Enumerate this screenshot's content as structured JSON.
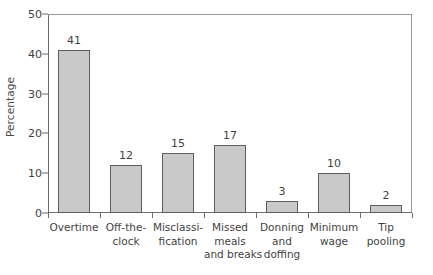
{
  "chart_data": {
    "type": "bar",
    "title": "",
    "subtitle": "",
    "xlabel": "",
    "ylabel": "Percentage",
    "ylim": [
      0,
      50
    ],
    "ytick_step": 10,
    "yticks": [
      0,
      10,
      20,
      30,
      40,
      50
    ],
    "grid": false,
    "legend": "none",
    "categories": [
      "Overtime",
      "Off-the-clock",
      "Misclassi-fication",
      "Missed meals and breaks",
      "Donning and doffing",
      "Minimum wage",
      "Tip pooling"
    ],
    "category_lines": [
      [
        "Overtime"
      ],
      [
        "Off-the-",
        "clock"
      ],
      [
        "Misclassi-",
        "fication"
      ],
      [
        "Missed",
        "meals",
        "and breaks"
      ],
      [
        "Donning",
        "and",
        "doffing"
      ],
      [
        "Minimum",
        "wage"
      ],
      [
        "Tip",
        "pooling"
      ]
    ],
    "values": [
      41,
      12,
      15,
      17,
      3,
      10,
      2
    ],
    "value_labels": [
      "41",
      "12",
      "15",
      "17",
      "3",
      "10",
      "2"
    ],
    "bar_fill_color": "#c9c9c9",
    "bar_edge_color": "#5e5e5e",
    "axis_color": "#6d6d6d",
    "frame_color": "#9b9b9b",
    "text_color": "#3f3f3f",
    "background_color": "#ffffff"
  }
}
